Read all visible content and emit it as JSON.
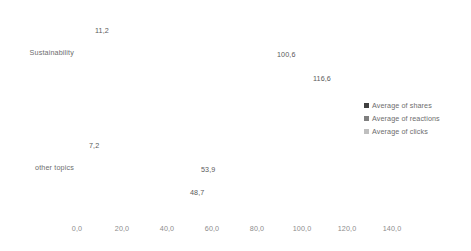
{
  "chart_data": {
    "type": "bar",
    "orientation": "horizontal",
    "title": "",
    "xlabel": "",
    "ylabel": "",
    "categories": [
      "Sustainability",
      "other topics"
    ],
    "series": [
      {
        "name": "Average of shares",
        "color": "#404040",
        "values": [
          11.2,
          7.2
        ],
        "labels": [
          "11,2",
          "7,2"
        ]
      },
      {
        "name": "Average of reactions",
        "color": "#7f7f7f",
        "values": [
          100.6,
          53.9
        ],
        "labels": [
          "100,6",
          "53,9"
        ]
      },
      {
        "name": "Average of clicks",
        "color": "#bfbfbf",
        "values": [
          116.6,
          48.7
        ],
        "labels": [
          "116,6",
          "48,7"
        ]
      }
    ],
    "xlim": [
      0,
      140
    ],
    "xticks": [
      0,
      20,
      40,
      60,
      80,
      100,
      120,
      140
    ],
    "xtick_labels": [
      "0,0",
      "20,0",
      "40,0",
      "60,0",
      "80,0",
      "100,0",
      "120,0",
      "140,0"
    ],
    "grid": false,
    "legend_position": "right"
  },
  "axis": {
    "ticks": [
      {
        "label": "0,0"
      },
      {
        "label": "20,0"
      },
      {
        "label": "40,0"
      },
      {
        "label": "60,0"
      },
      {
        "label": "80,0"
      },
      {
        "label": "100,0"
      },
      {
        "label": "120,0"
      },
      {
        "label": "140,0"
      }
    ]
  },
  "groups": [
    {
      "category": "Sustainability",
      "bars": [
        {
          "label": "11,2"
        },
        {
          "label": "100,6"
        },
        {
          "label": "116,6"
        }
      ]
    },
    {
      "category": "other topics",
      "bars": [
        {
          "label": "7,2"
        },
        {
          "label": "53,9"
        },
        {
          "label": "48,7"
        }
      ]
    }
  ],
  "legend": {
    "items": [
      {
        "label": "Average of shares"
      },
      {
        "label": "Average of reactions"
      },
      {
        "label": "Average of clicks"
      }
    ]
  }
}
